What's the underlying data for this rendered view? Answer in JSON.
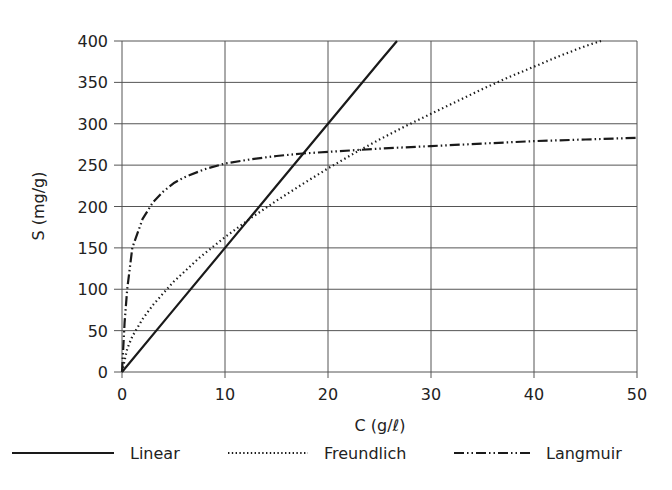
{
  "chart_data": {
    "type": "line",
    "title": "",
    "xlabel": "C (g/ℓ)",
    "ylabel": "S (mg/g)",
    "xlim": [
      0,
      50
    ],
    "ylim": [
      0,
      400
    ],
    "xticks": [
      0,
      10,
      20,
      30,
      40,
      50
    ],
    "yticks": [
      0,
      50,
      100,
      150,
      200,
      250,
      300,
      350,
      400
    ],
    "grid": true,
    "legend_position": "bottom",
    "series": [
      {
        "name": "Linear",
        "style": "solid",
        "x": [
          0,
          5,
          10,
          15,
          20,
          25,
          26.7
        ],
        "y": [
          0,
          75,
          150,
          225,
          300,
          375,
          400
        ]
      },
      {
        "name": "Freundlich",
        "style": "dotted",
        "x": [
          0,
          0.5,
          1,
          2,
          3,
          5,
          7.5,
          10,
          12.5,
          15,
          17.5,
          20,
          22.5,
          25,
          27.5,
          30,
          32.5,
          35,
          37.5,
          40,
          42.5,
          45,
          46.5
        ],
        "y": [
          0,
          28,
          43,
          64,
          81,
          109,
          138,
          163,
          186,
          207,
          227,
          246,
          264,
          281,
          297,
          312,
          327,
          342,
          356,
          369,
          382,
          394,
          400
        ]
      },
      {
        "name": "Langmuir",
        "style": "dash-dot-dot",
        "x": [
          0,
          0.25,
          0.5,
          1,
          2,
          3,
          4,
          5,
          6,
          8,
          10,
          12.5,
          15,
          17.5,
          20,
          25,
          30,
          35,
          40,
          45,
          50
        ],
        "y": [
          0,
          60,
          100,
          150,
          185,
          205,
          218,
          228,
          235,
          245,
          252,
          257,
          261,
          264,
          266,
          270,
          273,
          276,
          279,
          281,
          283
        ]
      }
    ]
  },
  "axes": {
    "xlabel": "C (g/ℓ)",
    "ylabel": "S (mg/g)",
    "xtick_labels": [
      "0",
      "10",
      "20",
      "30",
      "40",
      "50"
    ],
    "ytick_labels": [
      "0",
      "50",
      "100",
      "150",
      "200",
      "250",
      "300",
      "350",
      "400"
    ]
  },
  "legend": {
    "items": [
      {
        "label": "Linear",
        "style": "solid"
      },
      {
        "label": "Freundlich",
        "style": "dotted"
      },
      {
        "label": "Langmuir",
        "style": "dash-dot-dot"
      }
    ]
  },
  "colors": {
    "line": "#1a1a1a",
    "grid": "#555555",
    "text": "#222222",
    "background": "#ffffff"
  }
}
